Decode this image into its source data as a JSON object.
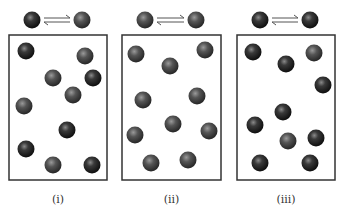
{
  "figure": {
    "colors": {
      "dark_sphere": "#1e1e1e",
      "gray_sphere": "#4a4a4a",
      "box_border": "#333333",
      "arrow": "#555555",
      "background": "#ffffff"
    },
    "panels": [
      {
        "label": "(i)",
        "box": {
          "x": 9,
          "y": 35,
          "w": 98,
          "h": 145
        },
        "equation": {
          "reactant": "dark",
          "product": "gray",
          "rx": 32,
          "px": 82,
          "y": 20
        },
        "spheres": [
          {
            "x": 26,
            "y": 51,
            "type": "dark"
          },
          {
            "x": 85,
            "y": 56,
            "type": "gray"
          },
          {
            "x": 53,
            "y": 78,
            "type": "gray"
          },
          {
            "x": 93,
            "y": 78,
            "type": "dark"
          },
          {
            "x": 73,
            "y": 95,
            "type": "gray"
          },
          {
            "x": 24,
            "y": 106,
            "type": "gray"
          },
          {
            "x": 67,
            "y": 130,
            "type": "dark"
          },
          {
            "x": 26,
            "y": 149,
            "type": "dark"
          },
          {
            "x": 53,
            "y": 165,
            "type": "gray"
          },
          {
            "x": 92,
            "y": 165,
            "type": "dark"
          }
        ]
      },
      {
        "label": "(ii)",
        "box": {
          "x": 122,
          "y": 35,
          "w": 99,
          "h": 145
        },
        "equation": {
          "reactant": "gray",
          "product": "gray",
          "rx": 145,
          "px": 196,
          "y": 20
        },
        "spheres": [
          {
            "x": 136,
            "y": 54,
            "type": "gray"
          },
          {
            "x": 205,
            "y": 50,
            "type": "gray"
          },
          {
            "x": 170,
            "y": 66,
            "type": "gray"
          },
          {
            "x": 143,
            "y": 100,
            "type": "gray"
          },
          {
            "x": 197,
            "y": 96,
            "type": "gray"
          },
          {
            "x": 173,
            "y": 124,
            "type": "gray"
          },
          {
            "x": 135,
            "y": 135,
            "type": "gray"
          },
          {
            "x": 209,
            "y": 131,
            "type": "gray"
          },
          {
            "x": 151,
            "y": 163,
            "type": "gray"
          },
          {
            "x": 188,
            "y": 160,
            "type": "gray"
          }
        ]
      },
      {
        "label": "(iii)",
        "box": {
          "x": 237,
          "y": 35,
          "w": 98,
          "h": 145
        },
        "equation": {
          "reactant": "dark",
          "product": "dark",
          "rx": 260,
          "px": 310,
          "y": 20
        },
        "spheres": [
          {
            "x": 253,
            "y": 52,
            "type": "dark"
          },
          {
            "x": 314,
            "y": 53,
            "type": "gray"
          },
          {
            "x": 286,
            "y": 64,
            "type": "dark"
          },
          {
            "x": 323,
            "y": 85,
            "type": "dark"
          },
          {
            "x": 283,
            "y": 112,
            "type": "dark"
          },
          {
            "x": 255,
            "y": 125,
            "type": "dark"
          },
          {
            "x": 288,
            "y": 141,
            "type": "gray"
          },
          {
            "x": 316,
            "y": 138,
            "type": "dark"
          },
          {
            "x": 260,
            "y": 163,
            "type": "dark"
          },
          {
            "x": 310,
            "y": 163,
            "type": "dark"
          }
        ]
      }
    ]
  }
}
